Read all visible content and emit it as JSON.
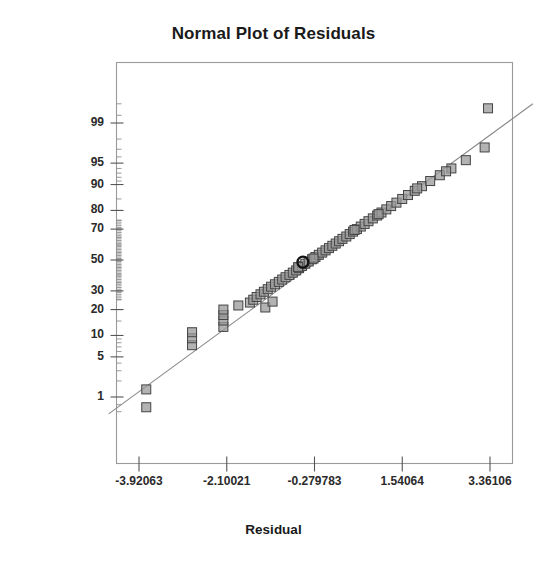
{
  "chart_data": {
    "type": "scatter",
    "title": "Normal Plot of Residuals",
    "xlabel": "Residual",
    "ylabel": "Normal % Probability",
    "grid": false,
    "legend": null,
    "xlim": [
      -4.8,
      4.3
    ],
    "ylim_percent": [
      0.3,
      99.8
    ],
    "yscale": "normal-probability",
    "xticks": [
      "-3.92063",
      "-2.10021",
      "-0.279783",
      "1.54064",
      "3.36106"
    ],
    "xtick_values": [
      -3.92063,
      -2.10021,
      -0.279783,
      1.54064,
      3.36106
    ],
    "yticks": [
      "99",
      "95",
      "90",
      "80",
      "70",
      "50",
      "30",
      "20",
      "10",
      "5",
      "1"
    ],
    "ytick_values": [
      99,
      95,
      90,
      80,
      70,
      50,
      30,
      20,
      10,
      5,
      1
    ],
    "reference_line": {
      "label": "normal-reference-line",
      "x": [
        -4.55,
        4.25
      ],
      "y_percent": [
        0.45,
        99.6
      ]
    },
    "marker_style": {
      "shape": "square",
      "fill": "#9a9a9a",
      "edge": "#444444",
      "size_px": 9
    },
    "highlight_marker": {
      "shape": "circle-outline",
      "edge": "#111111",
      "x": -0.52,
      "y_percent": 48.5
    },
    "points": [
      {
        "x": -3.77,
        "y": 1.4
      },
      {
        "x": -3.77,
        "y": 0.62
      },
      {
        "x": -2.82,
        "y": 7.4
      },
      {
        "x": -2.82,
        "y": 9.2
      },
      {
        "x": -2.82,
        "y": 11.0
      },
      {
        "x": -2.17,
        "y": 12.8
      },
      {
        "x": -2.17,
        "y": 15.2
      },
      {
        "x": -2.17,
        "y": 17.5
      },
      {
        "x": -2.17,
        "y": 20.0
      },
      {
        "x": -1.86,
        "y": 22.0
      },
      {
        "x": -1.62,
        "y": 23.5
      },
      {
        "x": -1.55,
        "y": 25.0
      },
      {
        "x": -1.48,
        "y": 26.5
      },
      {
        "x": -1.4,
        "y": 28.0
      },
      {
        "x": -1.33,
        "y": 29.5
      },
      {
        "x": -1.25,
        "y": 31.0
      },
      {
        "x": -1.18,
        "y": 32.5
      },
      {
        "x": -1.1,
        "y": 34.0
      },
      {
        "x": -1.02,
        "y": 35.5
      },
      {
        "x": -0.95,
        "y": 37.0
      },
      {
        "x": -0.88,
        "y": 38.5
      },
      {
        "x": -0.8,
        "y": 40.0
      },
      {
        "x": -0.73,
        "y": 41.5
      },
      {
        "x": -0.66,
        "y": 43.0
      },
      {
        "x": -0.6,
        "y": 44.5
      },
      {
        "x": -0.54,
        "y": 46.0
      },
      {
        "x": -0.47,
        "y": 47.5
      },
      {
        "x": -0.4,
        "y": 49.0
      },
      {
        "x": -0.33,
        "y": 50.5
      },
      {
        "x": -0.26,
        "y": 52.0
      },
      {
        "x": -0.19,
        "y": 53.5
      },
      {
        "x": -0.12,
        "y": 55.0
      },
      {
        "x": -0.05,
        "y": 56.5
      },
      {
        "x": 0.02,
        "y": 58.0
      },
      {
        "x": 0.09,
        "y": 59.5
      },
      {
        "x": 0.16,
        "y": 61.0
      },
      {
        "x": 0.23,
        "y": 62.5
      },
      {
        "x": 0.3,
        "y": 64.0
      },
      {
        "x": 0.38,
        "y": 65.5
      },
      {
        "x": 0.45,
        "y": 67.0
      },
      {
        "x": 0.52,
        "y": 68.5
      },
      {
        "x": 0.6,
        "y": 70.0
      },
      {
        "x": 0.68,
        "y": 71.5
      },
      {
        "x": 0.76,
        "y": 73.0
      },
      {
        "x": 0.84,
        "y": 74.5
      },
      {
        "x": 0.93,
        "y": 76.0
      },
      {
        "x": 1.02,
        "y": 77.5
      },
      {
        "x": 1.11,
        "y": 79.0
      },
      {
        "x": 1.21,
        "y": 80.5
      },
      {
        "x": 1.31,
        "y": 82.0
      },
      {
        "x": 1.42,
        "y": 83.5
      },
      {
        "x": 1.54,
        "y": 85.0
      },
      {
        "x": 1.66,
        "y": 86.5
      },
      {
        "x": 1.8,
        "y": 88.0
      },
      {
        "x": 1.95,
        "y": 89.5
      },
      {
        "x": 2.12,
        "y": 91.0
      },
      {
        "x": 2.32,
        "y": 92.5
      },
      {
        "x": 2.56,
        "y": 94.0
      },
      {
        "x": 2.86,
        "y": 95.5
      },
      {
        "x": 3.25,
        "y": 97.2
      },
      {
        "x": 3.32,
        "y": 99.5
      },
      {
        "x": -1.3,
        "y": 21.0
      },
      {
        "x": -1.15,
        "y": 24.0
      },
      {
        "x": -0.62,
        "y": 45.2
      },
      {
        "x": -0.3,
        "y": 51.0
      },
      {
        "x": 0.55,
        "y": 69.5
      },
      {
        "x": 1.05,
        "y": 78.2
      },
      {
        "x": 1.85,
        "y": 88.8
      },
      {
        "x": 2.45,
        "y": 93.4
      }
    ]
  }
}
